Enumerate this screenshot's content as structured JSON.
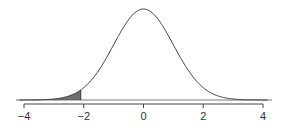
{
  "chart_data": {
    "type": "area",
    "title": "",
    "xlabel": "",
    "ylabel": "",
    "distribution": "standard normal",
    "mean": 0,
    "sd": 1,
    "xlim": [
      -4,
      4
    ],
    "shaded_region": {
      "from": -4,
      "to": -2.1,
      "tail": "lower"
    },
    "x_ticks": [
      -4,
      -2,
      0,
      2,
      4
    ],
    "tick_labels": [
      "−4",
      "−2",
      "0",
      "2",
      "4"
    ],
    "grid": false,
    "legend": null,
    "colors": {
      "curve": "#333333",
      "shade": "#666666",
      "axis": "#444444"
    }
  }
}
